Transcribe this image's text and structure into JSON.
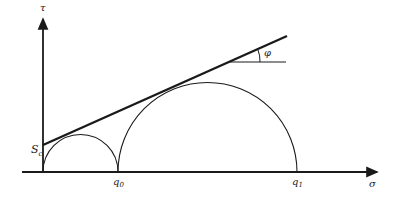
{
  "diagram": {
    "axes": {
      "y_label": "τ",
      "x_label": "σ"
    },
    "labels": {
      "intercept": "S",
      "intercept_sub": "c",
      "q0": "q",
      "q0_sub": "0",
      "q1": "q",
      "q1_sub": "1",
      "angle": "φ"
    },
    "colors": {
      "stroke": "#1a1a1a",
      "background": "#ffffff"
    }
  }
}
